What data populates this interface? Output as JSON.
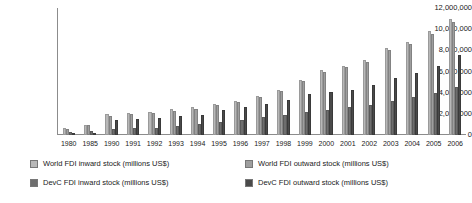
{
  "chart_data": {
    "type": "bar",
    "title": "",
    "xlabel": "",
    "ylabel": "",
    "ylim": [
      0,
      12000000
    ],
    "ytick_values": [
      12000000,
      10000000,
      8000000,
      6000000,
      4000000,
      2000000,
      0
    ],
    "ytick_labels": [
      "12,000,000",
      "10,000,000",
      "8,000,000",
      "6,000,000",
      "4,000,000",
      "2,000,000",
      "0"
    ],
    "grid": false,
    "legend_position": "bottom",
    "categories": [
      "1980",
      "1985",
      "1990",
      "1991",
      "1992",
      "1993",
      "1994",
      "1995",
      "1996",
      "1997",
      "1998",
      "1999",
      "2000",
      "2001",
      "2002",
      "2003",
      "2004",
      "2005",
      "2006"
    ],
    "series": [
      {
        "name": "World FDI  inward stock (millions US$)",
        "color": "#b8b8b8",
        "values": [
          700000,
          980000,
          1950000,
          2100000,
          2200000,
          2450000,
          2600000,
          2900000,
          3200000,
          3700000,
          4300000,
          5200000,
          6100000,
          6500000,
          7100000,
          8200000,
          8800000,
          9800000,
          11000000
        ]
      },
      {
        "name": "World FDI  outward stock (millions US$)",
        "color": "#9e9e9e",
        "values": [
          570000,
          900000,
          1800000,
          1950000,
          2050000,
          2300000,
          2500000,
          2800000,
          3100000,
          3600000,
          4200000,
          5100000,
          6000000,
          6400000,
          6900000,
          8000000,
          8600000,
          9500000,
          10700000
        ]
      },
      {
        "name": "DevC FDI  inward stock (millions US$)",
        "color": "#6e6e6e",
        "values": [
          300000,
          400000,
          550000,
          620000,
          700000,
          850000,
          1000000,
          1200000,
          1400000,
          1700000,
          1900000,
          2150000,
          2400000,
          2600000,
          2800000,
          3200000,
          3600000,
          4000000,
          4500000
        ]
      },
      {
        "name": "DevC FDI  outward stock (millions US$)",
        "color": "#4a4a4a",
        "values": [
          100000,
          220000,
          1400000,
          1500000,
          1600000,
          1750000,
          1900000,
          2350000,
          2600000,
          2900000,
          3300000,
          3900000,
          4100000,
          4300000,
          4700000,
          5400000,
          5900000,
          6500000,
          7600000
        ]
      }
    ]
  },
  "footnote": {
    "text": ""
  }
}
